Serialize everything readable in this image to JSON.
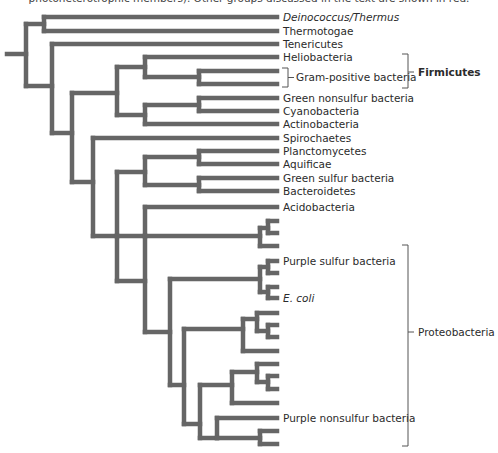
{
  "caption": "photoheterotrophic members). Other groups discussed in the text are shown in red.",
  "colors": {
    "branch": "#666666",
    "text": "#2b2b2b",
    "bracket": "#555555"
  },
  "tree": {
    "stroke_width": 4.5,
    "segments": [
      [
        7,
        54,
        26,
        54
      ],
      [
        26,
        24,
        26,
        86
      ],
      [
        26,
        24,
        44,
        24
      ],
      [
        44,
        17,
        44,
        31
      ],
      [
        44,
        17,
        277,
        17
      ],
      [
        44,
        31,
        277,
        31
      ],
      [
        26,
        86,
        52,
        86
      ],
      [
        52,
        44,
        52,
        133
      ],
      [
        52,
        44,
        277,
        44
      ],
      [
        52,
        133,
        72,
        133
      ],
      [
        72,
        93,
        72,
        182
      ],
      [
        72,
        93,
        117,
        93
      ],
      [
        117,
        67,
        117,
        115
      ],
      [
        117,
        67,
        145,
        67
      ],
      [
        145,
        57,
        145,
        77
      ],
      [
        145,
        57,
        277,
        57
      ],
      [
        145,
        77,
        199,
        77
      ],
      [
        199,
        71,
        199,
        84
      ],
      [
        199,
        71,
        277,
        71
      ],
      [
        199,
        84,
        277,
        84
      ],
      [
        117,
        115,
        145,
        115
      ],
      [
        145,
        105,
        145,
        124
      ],
      [
        145,
        105,
        199,
        105
      ],
      [
        199,
        98,
        199,
        111
      ],
      [
        199,
        98,
        277,
        98
      ],
      [
        199,
        111,
        277,
        111
      ],
      [
        145,
        124,
        277,
        124
      ],
      [
        72,
        182,
        93,
        182
      ],
      [
        93,
        138,
        93,
        236
      ],
      [
        93,
        138,
        277,
        138
      ],
      [
        93,
        236,
        117,
        236
      ],
      [
        117,
        172,
        117,
        236
      ],
      [
        117,
        172,
        145,
        172
      ],
      [
        145,
        157,
        145,
        185
      ],
      [
        145,
        157,
        199,
        157
      ],
      [
        199,
        151,
        199,
        164
      ],
      [
        199,
        151,
        277,
        151
      ],
      [
        199,
        164,
        277,
        164
      ],
      [
        145,
        185,
        199,
        185
      ],
      [
        199,
        178,
        199,
        191
      ],
      [
        199,
        178,
        277,
        178
      ],
      [
        199,
        191,
        277,
        191
      ],
      [
        117,
        236,
        117,
        281
      ],
      [
        117,
        236,
        145,
        236
      ],
      [
        145,
        207,
        145,
        236
      ],
      [
        117,
        281,
        145,
        281
      ],
      [
        145,
        207,
        277,
        207
      ],
      [
        145,
        236,
        145,
        332
      ],
      [
        145,
        236,
        260,
        236
      ],
      [
        260,
        228,
        260,
        246
      ],
      [
        260,
        228,
        268,
        228
      ],
      [
        268,
        221,
        268,
        233
      ],
      [
        268,
        221,
        277,
        221
      ],
      [
        268,
        233,
        277,
        233
      ],
      [
        260,
        246,
        277,
        246
      ],
      [
        145,
        332,
        170,
        332
      ],
      [
        170,
        279,
        170,
        385
      ],
      [
        170,
        279,
        260,
        279
      ],
      [
        260,
        267,
        260,
        292
      ],
      [
        260,
        267,
        268,
        267
      ],
      [
        268,
        261,
        268,
        273
      ],
      [
        268,
        261,
        277,
        261
      ],
      [
        268,
        273,
        277,
        273
      ],
      [
        260,
        292,
        268,
        292
      ],
      [
        268,
        287,
        268,
        298
      ],
      [
        268,
        287,
        277,
        287
      ],
      [
        268,
        298,
        277,
        298
      ],
      [
        170,
        385,
        184,
        385
      ],
      [
        184,
        329,
        184,
        424
      ],
      [
        184,
        329,
        243,
        329
      ],
      [
        243,
        319,
        243,
        351
      ],
      [
        243,
        319,
        257,
        319
      ],
      [
        257,
        313,
        257,
        331
      ],
      [
        257,
        313,
        277,
        313
      ],
      [
        257,
        331,
        268,
        331
      ],
      [
        268,
        325,
        268,
        337
      ],
      [
        268,
        325,
        277,
        325
      ],
      [
        268,
        337,
        277,
        337
      ],
      [
        243,
        351,
        277,
        351
      ],
      [
        184,
        424,
        200,
        424
      ],
      [
        200,
        385,
        200,
        438
      ],
      [
        200,
        385,
        232,
        385
      ],
      [
        232,
        372,
        232,
        403
      ],
      [
        232,
        372,
        257,
        372
      ],
      [
        257,
        364,
        257,
        382
      ],
      [
        257,
        364,
        277,
        364
      ],
      [
        257,
        382,
        268,
        382
      ],
      [
        268,
        376,
        268,
        389
      ],
      [
        268,
        376,
        277,
        376
      ],
      [
        268,
        389,
        277,
        389
      ],
      [
        232,
        403,
        277,
        403
      ],
      [
        200,
        438,
        217,
        438
      ],
      [
        217,
        418,
        217,
        438
      ],
      [
        217,
        418,
        277,
        418
      ],
      [
        217,
        438,
        260,
        438
      ],
      [
        260,
        431,
        260,
        444
      ],
      [
        260,
        431,
        277,
        431
      ],
      [
        260,
        444,
        277,
        444
      ]
    ]
  },
  "leaves": [
    {
      "label": "Deinococcus/Thermus",
      "y": 17,
      "italic": true
    },
    {
      "label": "Thermotogae",
      "y": 31
    },
    {
      "label": "Tenericutes",
      "y": 44
    },
    {
      "label": "Heliobacteria",
      "y": 57
    },
    {
      "label": "Gram-positive bacteria",
      "y": 77,
      "x": 296
    },
    {
      "label": "Green nonsulfur bacteria",
      "y": 98
    },
    {
      "label": "Cyanobacteria",
      "y": 111
    },
    {
      "label": "Actinobacteria",
      "y": 124
    },
    {
      "label": "Spirochaetes",
      "y": 138
    },
    {
      "label": "Planctomycetes",
      "y": 151
    },
    {
      "label": "Aquificae",
      "y": 164
    },
    {
      "label": "Green sulfur bacteria",
      "y": 178
    },
    {
      "label": "Bacteroidetes",
      "y": 191
    },
    {
      "label": "Acidobacteria",
      "y": 207
    },
    {
      "label": "Purple sulfur bacteria",
      "y": 261
    },
    {
      "label": "E. coli",
      "y": 298,
      "italic": true
    },
    {
      "label": "Purple nonsulfur bacteria",
      "y": 418
    }
  ],
  "groups": [
    {
      "label": "Firmicutes",
      "bold": true,
      "bracket": {
        "x": 408,
        "y1": 54,
        "y2": 88
      },
      "label_y": 72
    },
    {
      "label": "Gram-positive bracket",
      "bracket": {
        "x": 288,
        "y1": 68,
        "y2": 87
      }
    },
    {
      "label": "Proteobacteria",
      "bracket": {
        "x": 408,
        "y1": 245,
        "y2": 446
      },
      "label_y": 332
    }
  ],
  "labels": {
    "deinococcus": "Deinococcus/Thermus",
    "thermotogae": "Thermotogae",
    "tenericutes": "Tenericutes",
    "heliobacteria": "Heliobacteria",
    "gram_positive": "Gram-positive bacteria",
    "firmicutes": "Firmicutes",
    "green_nonsulfur": "Green nonsulfur bacteria",
    "cyanobacteria": "Cyanobacteria",
    "actinobacteria": "Actinobacteria",
    "spirochaetes": "Spirochaetes",
    "planctomycetes": "Planctomycetes",
    "aquificae": "Aquificae",
    "green_sulfur": "Green sulfur bacteria",
    "bacteroidetes": "Bacteroidetes",
    "acidobacteria": "Acidobacteria",
    "purple_sulfur": "Purple sulfur bacteria",
    "e_coli": "E. coli",
    "purple_nonsulfur": "Purple nonsulfur bacteria",
    "proteobacteria": "Proteobacteria"
  }
}
